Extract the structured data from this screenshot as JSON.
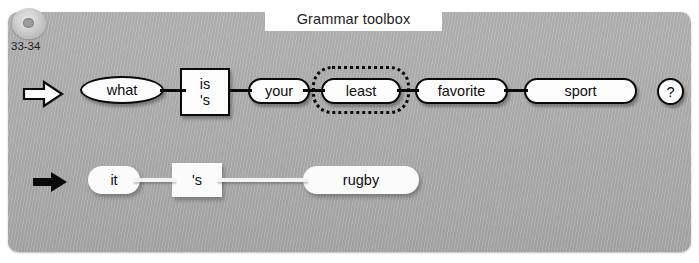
{
  "header": {
    "title": "Grammar toolbox"
  },
  "media": {
    "cd_icon": "cd-disc-icon",
    "track_label": "33-34"
  },
  "rows": [
    {
      "id": "question-row",
      "marker_icon": "white-right-arrow-icon",
      "tokens": [
        {
          "id": "what",
          "label": "what",
          "shape": "ellipse",
          "style": "strong"
        },
        {
          "id": "is-s",
          "label": "is",
          "label2": "'s",
          "shape": "rect",
          "style": "strong"
        },
        {
          "id": "your",
          "label": "your",
          "shape": "pill",
          "style": "strong"
        },
        {
          "id": "least",
          "label": "least",
          "shape": "pill",
          "style": "strong",
          "selected": true
        },
        {
          "id": "favorite",
          "label": "favorite",
          "shape": "pill",
          "style": "strong"
        },
        {
          "id": "sport",
          "label": "sport",
          "shape": "pill",
          "style": "strong"
        },
        {
          "id": "question-mark",
          "label": "?",
          "shape": "circle",
          "style": "strong"
        }
      ]
    },
    {
      "id": "answer-row",
      "marker_icon": "black-right-arrow-icon",
      "tokens": [
        {
          "id": "it",
          "label": "it",
          "shape": "pill",
          "style": "soft"
        },
        {
          "id": "s",
          "label": "'s",
          "shape": "rect",
          "style": "soft"
        },
        {
          "id": "rugby",
          "label": "rugby",
          "shape": "pill",
          "style": "soft"
        }
      ]
    }
  ],
  "colors": {
    "panel_background": "#adadad",
    "token_fill": "#fdfdfd",
    "outline": "#0a0a0a",
    "banner_background": "#ffffff"
  }
}
